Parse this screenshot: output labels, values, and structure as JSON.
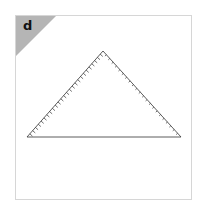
{
  "panel": {
    "label": "d",
    "corner_color": "#b5b5b5",
    "border_color": "#d6d6d6"
  },
  "diagram": {
    "shape": "triangle",
    "vertices": {
      "apex": [
        103,
        51
      ],
      "left": [
        27,
        137
      ],
      "right": [
        181,
        137
      ]
    },
    "left_edge_ticks": 26,
    "right_edge_ticks": 22,
    "line_color": "#333333"
  }
}
